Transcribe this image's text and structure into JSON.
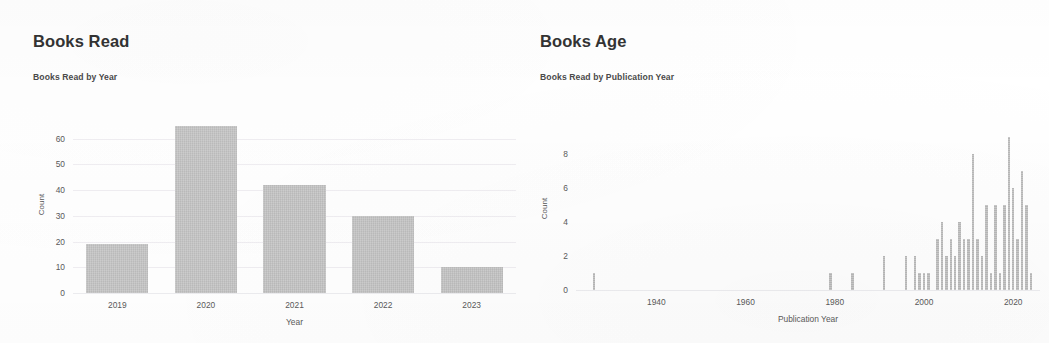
{
  "page": {
    "background_color": "#ffffff",
    "bar_color": "#c3c3c3",
    "text_color": "#3b3b3b"
  },
  "panels": [
    {
      "id": "books-read",
      "title": "Books Read",
      "subtitle": "Books Read by Year"
    },
    {
      "id": "books-age",
      "title": "Books Age",
      "subtitle": "Books Read by Publication Year"
    }
  ],
  "chart_data": [
    {
      "type": "bar",
      "id": "books-read-by-year",
      "title": "Books Read by Year",
      "xlabel": "Year",
      "ylabel": "Count",
      "categories": [
        "2019",
        "2020",
        "2021",
        "2022",
        "2023"
      ],
      "values": [
        19,
        65,
        42,
        30,
        10
      ],
      "ylim": [
        0,
        68
      ],
      "yticks": [
        0,
        10,
        20,
        30,
        40,
        50,
        60
      ],
      "ytick_labels": [
        "0",
        "10",
        "20",
        "30",
        "40",
        "50",
        "60"
      ],
      "grid": true,
      "legend": false
    },
    {
      "type": "bar",
      "id": "books-read-by-publication-year",
      "title": "Books Read by Publication Year",
      "xlabel": "Publication Year",
      "ylabel": "Count",
      "xlim": [
        1922,
        2026
      ],
      "ylim": [
        0,
        9.4
      ],
      "yticks": [
        0,
        2,
        4,
        6,
        8
      ],
      "ytick_labels": [
        "0",
        "2",
        "4",
        "6",
        "8"
      ],
      "xticks": [
        1940,
        1960,
        1980,
        2000,
        2020
      ],
      "xtick_labels": [
        "1940",
        "1960",
        "1980",
        "2000",
        "2020"
      ],
      "grid": false,
      "legend": false,
      "x": [
        1926,
        1979,
        1984,
        1991,
        1996,
        1998,
        1999,
        2000,
        2001,
        2003,
        2004,
        2005,
        2006,
        2007,
        2008,
        2009,
        2010,
        2011,
        2012,
        2013,
        2014,
        2015,
        2016,
        2017,
        2018,
        2019,
        2020,
        2021,
        2022,
        2023,
        2024
      ],
      "values": [
        1,
        1,
        1,
        2,
        2,
        2,
        1,
        1,
        1,
        3,
        4,
        2,
        3,
        2,
        4,
        3,
        3,
        8,
        3,
        2,
        5,
        1,
        5,
        1,
        5,
        9,
        6,
        3,
        7,
        5,
        1
      ]
    }
  ]
}
